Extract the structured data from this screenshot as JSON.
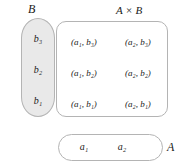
{
  "diagram": {
    "colors": {
      "set_b_fill": "#e9e9e9",
      "set_a_fill": "#ffffff",
      "product_fill": "#ffffff",
      "stroke": "#b4b4b4",
      "text": "#1a1a1a",
      "background": "#ffffff"
    }
  },
  "set_b": {
    "label": "B",
    "shape": "vertical-stadium",
    "elements": [
      {
        "text": "b₃"
      },
      {
        "text": "b₂"
      },
      {
        "text": "b₁"
      }
    ]
  },
  "set_a": {
    "label": "A",
    "shape": "horizontal-stadium",
    "elements": [
      {
        "text": "a₁"
      },
      {
        "text": "a₂"
      }
    ]
  },
  "product": {
    "label": "A × B",
    "shape": "rounded-rectangle",
    "rows": [
      {
        "b_value": "b₃",
        "cells": [
          {
            "text": "(a₁, b₃)"
          },
          {
            "text": "(a₂, b₃)"
          }
        ]
      },
      {
        "b_value": "b₂",
        "cells": [
          {
            "text": "(a₁, b₂)"
          },
          {
            "text": "(a₂, b₂)"
          }
        ]
      },
      {
        "b_value": "b₁",
        "cells": [
          {
            "text": "(a₁, b₁)"
          },
          {
            "text": "(a₂, b₁)"
          }
        ]
      }
    ]
  }
}
